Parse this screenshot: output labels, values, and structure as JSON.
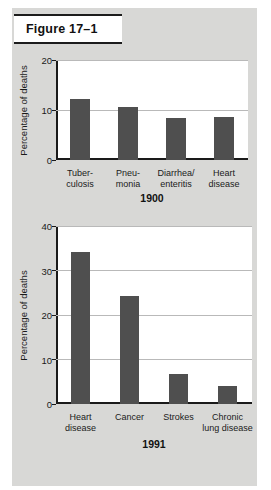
{
  "figure": {
    "title": "Figure 17–1"
  },
  "colors": {
    "bar": "#4f4f4f",
    "paper": "#d8d8d6",
    "plot_background": "#ffffff",
    "axis": "#1a1a1a",
    "gridline": "#b9b9b9"
  },
  "charts": [
    {
      "id": "chart1",
      "ylabel": "Percentage of deaths",
      "year": "1900",
      "yticks": [
        "0",
        "10",
        "20"
      ],
      "chart_data": {
        "type": "bar",
        "title": "1900",
        "xlabel": "1900",
        "ylabel": "Percentage of deaths",
        "ylim": [
          0,
          20
        ],
        "yticks": [
          0,
          10,
          20
        ],
        "grid": true,
        "legend": false,
        "categories": [
          "Tuber-\nculosis",
          "Pneu-\nmonia",
          "Diarrhea/\nenteritis",
          "Heart\ndisease"
        ],
        "values": [
          12.5,
          10.8,
          8.6,
          8.8
        ]
      },
      "bars": [
        {
          "label_line1": "Tuber-",
          "label_line2": "culosis",
          "value": 12.5
        },
        {
          "label_line1": "Pneu-",
          "label_line2": "monia",
          "value": 10.8
        },
        {
          "label_line1": "Diarrhea/",
          "label_line2": "enteritis",
          "value": 8.6
        },
        {
          "label_line1": "Heart",
          "label_line2": "disease",
          "value": 8.8
        }
      ]
    },
    {
      "id": "chart2",
      "ylabel": "Percentage of deaths",
      "year": "1991",
      "yticks": [
        "0",
        "10",
        "20",
        "30",
        "40"
      ],
      "chart_data": {
        "type": "bar",
        "title": "1991",
        "xlabel": "1991",
        "ylabel": "Percentage of deaths",
        "ylim": [
          0,
          40
        ],
        "yticks": [
          0,
          10,
          20,
          30,
          40
        ],
        "grid": true,
        "legend": false,
        "categories": [
          "Heart\ndisease",
          "Cancer",
          "Strokes",
          "Chronic\nlung disease"
        ],
        "values": [
          34.6,
          24.5,
          6.8,
          4.0
        ]
      },
      "bars": [
        {
          "label_line1": "Heart",
          "label_line2": "disease",
          "value": 34.6
        },
        {
          "label_line1": "Cancer",
          "label_line2": "",
          "value": 24.5
        },
        {
          "label_line1": "Strokes",
          "label_line2": "",
          "value": 6.8
        },
        {
          "label_line1": "Chronic",
          "label_line2": "lung disease",
          "value": 4.0
        }
      ]
    }
  ]
}
